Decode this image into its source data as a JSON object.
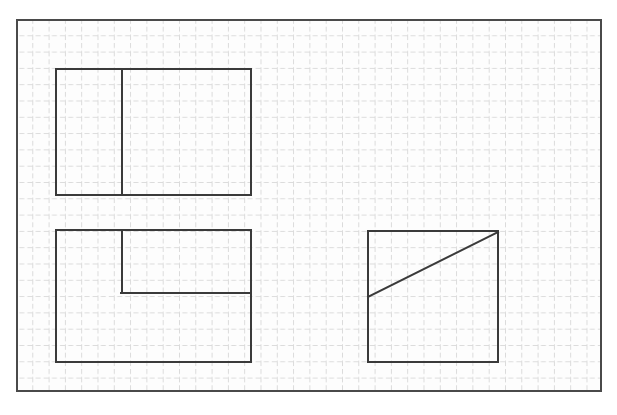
{
  "page": {
    "width": 617,
    "height": 415,
    "background_color": "#ffffff",
    "ghost_header_text": ""
  },
  "grid": {
    "label": "graph-paper-grid",
    "origin_x": 16,
    "origin_y": 19,
    "width": 586,
    "height": 373,
    "cell_size": 16.3,
    "columns": 36,
    "rows": 23,
    "line_style": "dashed",
    "line_color": "#b9b9b9",
    "line_width": 1,
    "dash_pattern": "5 3",
    "fill_color": "#fdfdfd",
    "border_color": "#4a4a4a",
    "border_width": 2
  },
  "figures": [
    {
      "id": "top-left-stepped-rectangle",
      "name": "Top left rectangle with vertical divider",
      "type": "rectangle-with-divider",
      "stroke_color": "#3a3a3a",
      "stroke_width": 2,
      "x": 56,
      "y": 69,
      "right": 251,
      "bottom": 195,
      "width": 195,
      "height": 126,
      "divider_x": 122,
      "divider_from_y": 69,
      "divider_to_y": 195
    },
    {
      "id": "bottom-left-stepped-rectangle",
      "name": "Bottom left rectangle with inner step",
      "type": "rectangle-with-step",
      "stroke_color": "#3a3a3a",
      "stroke_width": 2,
      "x": 56,
      "y": 230,
      "right": 251,
      "bottom": 362,
      "width": 195,
      "height": 132,
      "step_vertical_x": 122,
      "step_vertical_from_y": 230,
      "step_vertical_to_y": 293,
      "step_horizontal_y": 293,
      "step_horizontal_from_x": 122,
      "step_horizontal_to_x": 251
    },
    {
      "id": "right-rectangle-with-diagonal",
      "name": "Right rectangle with diagonal line",
      "type": "rectangle-with-diagonal",
      "stroke_color": "#3a3a3a",
      "stroke_width": 2,
      "x": 368,
      "y": 231,
      "right": 498,
      "bottom": 362,
      "width": 130,
      "height": 131,
      "diagonal_x1": 368,
      "diagonal_y1": 297,
      "diagonal_x2": 498,
      "diagonal_y2": 232
    }
  ]
}
